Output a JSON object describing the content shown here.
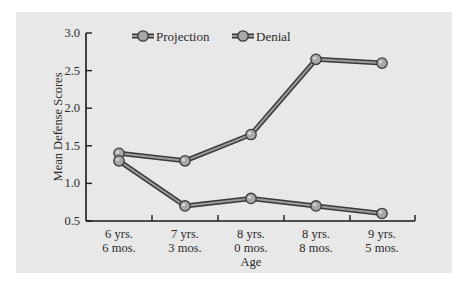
{
  "chart_data": {
    "type": "line",
    "title": "",
    "xlabel": "Age",
    "ylabel": "Mean Defense Scores",
    "categories": [
      [
        "6 yrs.",
        "6 mos."
      ],
      [
        "7 yrs.",
        "3 mos."
      ],
      [
        "8 yrs.",
        "0 mos."
      ],
      [
        "8 yrs.",
        "8 mos."
      ],
      [
        "9 yrs.",
        "5 mos."
      ]
    ],
    "series": [
      {
        "name": "Projection",
        "values": [
          1.4,
          1.3,
          1.65,
          2.65,
          2.6
        ]
      },
      {
        "name": "Denial",
        "values": [
          1.3,
          0.7,
          0.8,
          0.7,
          0.6
        ]
      }
    ],
    "ylim": [
      0.5,
      3.0
    ],
    "yticks": [
      "0.5",
      "1.0",
      "1.5",
      "2.0",
      "2.5",
      "3.0"
    ],
    "grid": false,
    "legend_position": "top",
    "colors": {
      "panel_bg": "#e8e8e8",
      "line_outline": "#3a3a3a",
      "line_fill": "#9a9a9a",
      "marker_fill": "#a8a8a8",
      "marker_stroke": "#3a3a3a",
      "axis": "#1a1a1a"
    }
  }
}
